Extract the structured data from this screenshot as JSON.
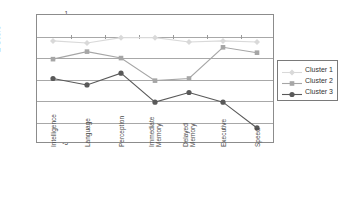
{
  "chart_data": {
    "type": "line",
    "title": "",
    "xlabel": "",
    "ylabel": "Z-Score",
    "ylim": [
      -5,
      1
    ],
    "yticks": [
      "1",
      "0",
      "-1",
      "-2",
      "-3",
      "-4",
      "-5"
    ],
    "grid": true,
    "legend_position": "right",
    "categories": [
      "Intelligence",
      "Language",
      "Perception",
      "Immediate\nMemory",
      "Delayed\nMemory",
      "Executive",
      "Speed"
    ],
    "series": [
      {
        "name": "Cluster 1",
        "color": "#d9d9d9",
        "marker": "diamond",
        "values": [
          -0.25,
          -0.35,
          -0.1,
          -0.1,
          -0.3,
          -0.25,
          -0.3
        ]
      },
      {
        "name": "Cluster 2",
        "color": "#a6a6a6",
        "marker": "square",
        "values": [
          -1.1,
          -0.75,
          -1.05,
          -2.1,
          -2.0,
          -0.55,
          -0.8
        ]
      },
      {
        "name": "Cluster 3",
        "color": "#595959",
        "marker": "circle",
        "values": [
          -2.0,
          -2.3,
          -1.75,
          -3.1,
          -2.65,
          -3.1,
          -4.3
        ]
      }
    ]
  },
  "legend": {
    "items": [
      {
        "label": "Cluster 1"
      },
      {
        "label": "Cluster 2"
      },
      {
        "label": "Cluster 3"
      }
    ]
  },
  "axes": {
    "y_label": "Z-Score",
    "y_ticks": [
      "1",
      "0",
      "-1",
      "-2",
      "-3",
      "-4",
      "-5"
    ],
    "x_labels": [
      "Intelligence",
      "Language",
      "Perception",
      "Immediate Memory",
      "Delayed Memory",
      "Executive",
      "Speed"
    ],
    "x_labels_lines": [
      [
        "Intelligence"
      ],
      [
        "Language"
      ],
      [
        "Perception"
      ],
      [
        "Immediate",
        "Memory"
      ],
      [
        "Delayed",
        "Memory"
      ],
      [
        "Executive"
      ],
      [
        "Speed"
      ]
    ]
  }
}
